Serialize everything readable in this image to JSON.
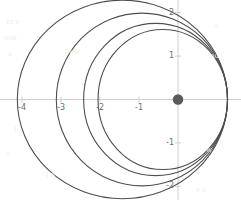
{
  "chart_data": {
    "type": "line",
    "title": "",
    "xlabel": "",
    "ylabel": "",
    "xlim": [
      -4.55,
      1.6
    ],
    "ylim": [
      -2.28,
      2.28
    ],
    "grid": false,
    "legend": null,
    "x_ticks": [
      {
        "value": -4,
        "label": "-4",
        "px": 22
      },
      {
        "value": -3,
        "label": "-3",
        "px": 61
      },
      {
        "value": -2,
        "label": "-2",
        "px": 100
      },
      {
        "value": -1,
        "label": "-1",
        "px": 139
      }
    ],
    "y_ticks": [
      {
        "value": 2,
        "label": "2",
        "px": 13
      },
      {
        "value": 1,
        "label": "1",
        "px": 56
      },
      {
        "value": -1,
        "label": "-1",
        "px": 143
      },
      {
        "value": -2,
        "label": "-2",
        "px": 186
      }
    ],
    "axes": {
      "x_axis_y_value": 0,
      "y_axis_x_value": 0,
      "color": "#cfcfcf",
      "x_axis_px_y": 99.5,
      "y_axis_px_x": 178.0,
      "px_per_unit_x": 39.0,
      "px_per_unit_y": 43.4
    },
    "focus_marker": {
      "name": "focus-point",
      "x": 0,
      "y": 0,
      "radius_px": 5.2,
      "color": "#595959"
    },
    "curve_color": "#4f4f4f",
    "curve_width": 1.1,
    "series": [
      {
        "name": "orbit-1",
        "aphelion_x": -4.12,
        "perihelion_x": 1.27,
        "semi_major": 2.695,
        "semi_minor": 2.288,
        "center_x": -1.425,
        "eccentricity": 0.529
      },
      {
        "name": "orbit-2",
        "aphelion_x": -3.12,
        "perihelion_x": 1.27,
        "semi_major": 2.195,
        "semi_minor": 1.991,
        "center_x": -0.925,
        "eccentricity": 0.421
      },
      {
        "name": "orbit-3",
        "aphelion_x": -2.42,
        "perihelion_x": 1.27,
        "semi_major": 1.845,
        "semi_minor": 1.753,
        "center_x": -0.575,
        "eccentricity": 0.312
      },
      {
        "name": "orbit-4",
        "aphelion_x": -2.05,
        "perihelion_x": 1.27,
        "semi_major": 1.66,
        "semi_minor": 1.614,
        "center_x": -0.39,
        "eccentricity": 0.235
      }
    ]
  },
  "background_artifacts": [
    {
      "text": "nt e",
      "x": 6,
      "y": 18
    },
    {
      "text": "ook",
      "x": 4,
      "y": 34
    },
    {
      "text": "a",
      "x": 8,
      "y": 50
    },
    {
      "text": "Dow",
      "x": 64,
      "y": 48
    },
    {
      "text": "l",
      "x": 14,
      "y": 126
    },
    {
      "text": "c",
      "x": 6,
      "y": 150
    },
    {
      "text": "i n",
      "x": 46,
      "y": 171
    },
    {
      "text": "o",
      "x": 214,
      "y": 22
    },
    {
      "text": "no",
      "x": 210,
      "y": 52
    },
    {
      "text": "w",
      "x": 206,
      "y": 146
    },
    {
      "text": "v a",
      "x": 196,
      "y": 186
    }
  ]
}
